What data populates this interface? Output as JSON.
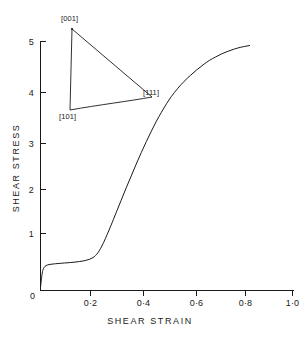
{
  "chart_data": {
    "type": "line",
    "title": "",
    "xlabel": "SHEAR STRAIN",
    "ylabel": "SHEAR STRESS",
    "xlim": [
      0,
      1.0
    ],
    "ylim": [
      0,
      5.2
    ],
    "grid": false,
    "legend": "none",
    "x_tick_labels": [
      "0",
      "0·2",
      "0·4",
      "0·6",
      "0·8",
      "1·0"
    ],
    "x_tick_values": [
      0,
      0.2,
      0.4,
      0.6,
      0.8,
      1.0
    ],
    "y_tick_labels": [
      "0",
      "1",
      "2",
      "3",
      "4",
      "5"
    ],
    "y_tick_values": [
      0,
      1,
      2,
      3,
      4,
      5
    ],
    "origin_label": "0",
    "series": [
      {
        "name": "shear stress-strain curve",
        "x": [
          0.0,
          0.004,
          0.008,
          0.014,
          0.022,
          0.034,
          0.05,
          0.07,
          0.095,
          0.12,
          0.145,
          0.165,
          0.18,
          0.195,
          0.208,
          0.218,
          0.228,
          0.238,
          0.25,
          0.265,
          0.28,
          0.3,
          0.32,
          0.34,
          0.36,
          0.38,
          0.4,
          0.42,
          0.44,
          0.46,
          0.48,
          0.5,
          0.52,
          0.545,
          0.57,
          0.595,
          0.62,
          0.645,
          0.67,
          0.695,
          0.72,
          0.745,
          0.77,
          0.795,
          0.815,
          0.83
        ],
        "y": [
          0.06,
          0.24,
          0.38,
          0.46,
          0.5,
          0.52,
          0.532,
          0.542,
          0.552,
          0.562,
          0.575,
          0.59,
          0.605,
          0.628,
          0.66,
          0.7,
          0.76,
          0.84,
          0.96,
          1.13,
          1.31,
          1.56,
          1.81,
          2.06,
          2.3,
          2.54,
          2.77,
          2.99,
          3.2,
          3.4,
          3.58,
          3.75,
          3.9,
          4.06,
          4.2,
          4.32,
          4.43,
          4.53,
          4.62,
          4.69,
          4.755,
          4.805,
          4.85,
          4.885,
          4.905,
          4.92
        ]
      }
    ],
    "annotations": {
      "inset": {
        "name": "stereographic-triangle",
        "corner_top_label": "[001]",
        "corner_bottom_left_label": "[101]",
        "corner_right_label": "[111]",
        "pole_marker": "dot at [001] corner"
      }
    }
  },
  "axes": {
    "y_title": "SHEAR STRESS",
    "x_title": "SHEAR STRAIN"
  }
}
